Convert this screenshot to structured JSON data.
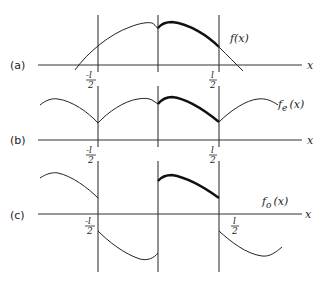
{
  "figure": {
    "panels": [
      {
        "id": "a",
        "label": "(a)",
        "function_label": "f(x)",
        "function_name": "f",
        "function_sub": "",
        "axis_label": "x",
        "ticks": [
          {
            "pos": "-l/2",
            "num": "-l",
            "den": "2"
          },
          {
            "pos": "l/2",
            "num": "l",
            "den": "2"
          }
        ]
      },
      {
        "id": "b",
        "label": "(b)",
        "function_label": "f_e(x)",
        "function_name": "f",
        "function_sub": "e",
        "axis_label": "x",
        "ticks": [
          {
            "pos": "-l/2",
            "num": "-l",
            "den": "2"
          },
          {
            "pos": "l/2",
            "num": "l",
            "den": "2"
          }
        ]
      },
      {
        "id": "c",
        "label": "(c)",
        "function_label": "f_o(x)",
        "function_name": "f",
        "function_sub": "o",
        "axis_label": "x",
        "ticks": [
          {
            "pos": "-l/2",
            "num": "-l",
            "den": "2"
          },
          {
            "pos": "l/2",
            "num": "l",
            "den": "2"
          }
        ]
      }
    ],
    "suffix": "(x)"
  }
}
